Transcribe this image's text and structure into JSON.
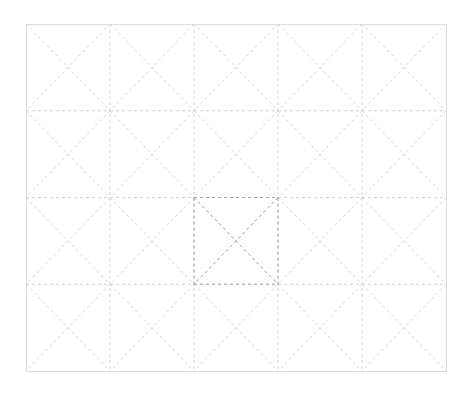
{
  "grid": {
    "left": 26,
    "top": 24,
    "right": 446,
    "bottom": 371,
    "columns": 5,
    "rows": 4,
    "highlight_cell": {
      "col": 2,
      "row": 2
    },
    "colors": {
      "border": "#dcdcdc",
      "grid_line": "#d2d2d2",
      "diagonal": "#d6d6d6",
      "highlight_line": "#a8a8a8",
      "background": "#ffffff"
    },
    "dash": "3,3"
  }
}
